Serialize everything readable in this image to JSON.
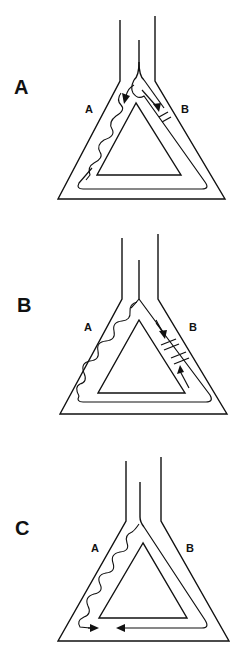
{
  "figure": {
    "panels": [
      {
        "id": "A",
        "label": "A",
        "left_arm_label": "A",
        "right_arm_label": "B",
        "blocks_in_B": 1,
        "arrows": [
          "down-left arm A (entering)",
          "down-right arm B toward block"
        ],
        "notes": "Impulse conducts slowly down limb A (wavy) and circulates around the loop; limb B shows a single unidirectional block."
      },
      {
        "id": "B",
        "label": "B",
        "left_arm_label": "A",
        "right_arm_label": "B",
        "blocks_in_B": 2,
        "arrows": [
          "down arm B toward upper block",
          "up arm B toward lower block"
        ],
        "notes": "Slow conduction down limb A; limb B has two block sites with wavefronts colliding from both sides."
      },
      {
        "id": "C",
        "label": "C",
        "left_arm_label": "A",
        "right_arm_label": "B",
        "blocks_in_B": 0,
        "arrows": [
          "rightward at base from arm A",
          "leftward at base from arm B"
        ],
        "notes": "Slow conduction down limb A and fast conduction down limb B meet and collide at the base of the loop."
      }
    ]
  },
  "colors": {
    "line": "#111111",
    "background": "#ffffff"
  }
}
